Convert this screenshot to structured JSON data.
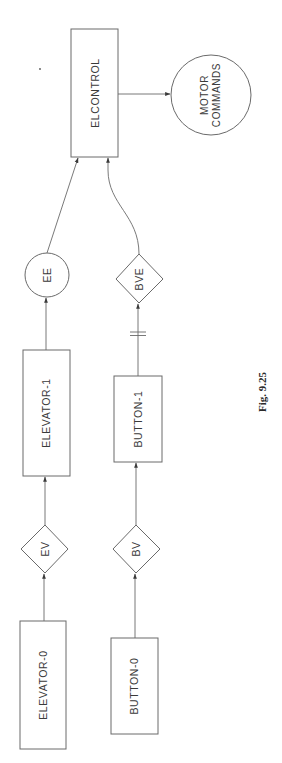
{
  "diagram": {
    "orientation": "rotated-90-ccw",
    "caption": "Fig. 9.25",
    "nodes": {
      "elcontrol": {
        "label": "ELCONTROL",
        "shape": "rectangle"
      },
      "motor_commands": {
        "label_line1": "MOTOR",
        "label_line2": "COMMANDS",
        "shape": "circle"
      },
      "ee": {
        "label": "EE",
        "shape": "circle"
      },
      "bve": {
        "label": "BVE",
        "shape": "diamond"
      },
      "elevator_1": {
        "label": "ELEVATOR-1",
        "shape": "rectangle"
      },
      "button_1": {
        "label": "BUTTON-1",
        "shape": "rectangle"
      },
      "ev": {
        "label": "EV",
        "shape": "diamond"
      },
      "bv": {
        "label": "BV",
        "shape": "diamond"
      },
      "elevator_0": {
        "label": "ELEVATOR-0",
        "shape": "rectangle"
      },
      "button_0": {
        "label": "BUTTON-0",
        "shape": "rectangle"
      }
    },
    "edges": [
      {
        "from": "elevator_0",
        "to": "ev"
      },
      {
        "from": "ev",
        "to": "elevator_1"
      },
      {
        "from": "elevator_1",
        "to": "ee"
      },
      {
        "from": "ee",
        "to": "elcontrol"
      },
      {
        "from": "button_0",
        "to": "bv"
      },
      {
        "from": "bv",
        "to": "button_1"
      },
      {
        "from": "button_1",
        "to": "bve",
        "marker": "double-bar"
      },
      {
        "from": "bve",
        "to": "elcontrol",
        "style": "curved"
      },
      {
        "from": "elcontrol",
        "to": "motor_commands"
      }
    ]
  }
}
